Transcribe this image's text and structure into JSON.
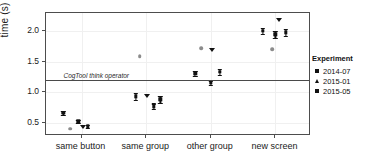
{
  "chart_data": {
    "type": "scatter",
    "title": "",
    "xlabel": "",
    "ylabel": "time (s)",
    "categories": [
      "same button",
      "same group",
      "other group",
      "new screen"
    ],
    "ylim": [
      0.28,
      2.3
    ],
    "yticks": [
      0.5,
      1.0,
      1.5,
      2.0
    ],
    "ytick_labels": [
      "0.5",
      "1.0",
      "1.5",
      "2.0"
    ],
    "grid": true,
    "legend_position": "right",
    "annotations": [
      {
        "name": "CogTool think operator",
        "type": "hline",
        "y": 1.2,
        "label": "CogTool think operator"
      }
    ],
    "series": [
      {
        "name": "2014-07",
        "marker": "square-open",
        "color": "#8c8c8c",
        "points": [
          {
            "category": "same button",
            "x": 0.82,
            "y": 0.4,
            "err": 0.0
          },
          {
            "category": "same group",
            "x": 1.9,
            "y": 1.59,
            "err": 0.0
          },
          {
            "category": "other group",
            "x": 2.85,
            "y": 1.72,
            "err": 0.0
          },
          {
            "category": "new screen",
            "x": 3.95,
            "y": 1.71,
            "err": 0.0
          }
        ]
      },
      {
        "name": "2015-01",
        "marker": "triangle-down",
        "color": "#111111",
        "points": [
          {
            "category": "same button",
            "x": 1.02,
            "y": 0.42,
            "err": 0.0
          },
          {
            "category": "same group",
            "x": 2.02,
            "y": 0.93,
            "err": 0.0
          },
          {
            "category": "other group",
            "x": 3.02,
            "y": 1.7,
            "err": 0.0
          },
          {
            "category": "new screen",
            "x": 4.05,
            "y": 2.18,
            "err": 0.0
          }
        ]
      },
      {
        "name": "2015-05",
        "marker": "square",
        "color": "#111111",
        "points": [
          {
            "category": "same button",
            "x": 0.72,
            "y": 0.66,
            "err": 0.035
          },
          {
            "category": "same button",
            "x": 0.95,
            "y": 0.52,
            "err": 0.03
          },
          {
            "category": "same button",
            "x": 1.1,
            "y": 0.44,
            "err": 0.028
          },
          {
            "category": "same group",
            "x": 1.84,
            "y": 0.93,
            "err": 0.055
          },
          {
            "category": "same group",
            "x": 2.12,
            "y": 0.77,
            "err": 0.045
          },
          {
            "category": "same group",
            "x": 2.22,
            "y": 0.88,
            "err": 0.06
          },
          {
            "category": "other group",
            "x": 2.76,
            "y": 1.31,
            "err": 0.04
          },
          {
            "category": "other group",
            "x": 3.0,
            "y": 1.15,
            "err": 0.038
          },
          {
            "category": "other group",
            "x": 3.14,
            "y": 1.33,
            "err": 0.045
          },
          {
            "category": "new screen",
            "x": 3.8,
            "y": 2.01,
            "err": 0.05
          },
          {
            "category": "new screen",
            "x": 4.0,
            "y": 1.95,
            "err": 0.055
          },
          {
            "category": "new screen",
            "x": 4.16,
            "y": 1.98,
            "err": 0.06
          }
        ]
      }
    ]
  },
  "legend": {
    "title": "Experiment",
    "items": [
      {
        "label": "2014-07",
        "marker": "square"
      },
      {
        "label": "2015-01",
        "marker": "triangle"
      },
      {
        "label": "2015-05",
        "marker": "square"
      }
    ]
  },
  "axes": {
    "y_title": "time (s)",
    "y_tick_labels": [
      "2.0",
      "1.5",
      "1.0",
      "0.5"
    ],
    "x_tick_labels": [
      "same button",
      "same group",
      "other group",
      "new screen"
    ]
  },
  "reference_line": {
    "label": "CogTool think operator"
  }
}
